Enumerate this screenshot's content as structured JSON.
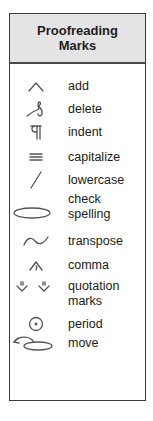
{
  "header": {
    "line1": "Proofreading",
    "line2": "Marks"
  },
  "marks": [
    {
      "icon": "caret-icon",
      "label": "add"
    },
    {
      "icon": "delete-loop-icon",
      "label": "delete"
    },
    {
      "icon": "paragraph-icon",
      "label": "indent"
    },
    {
      "icon": "triple-underline-icon",
      "label": "capitalize"
    },
    {
      "icon": "slash-icon",
      "label": "lowercase"
    },
    {
      "icon": "ellipse-icon",
      "label_line1": "check",
      "label_line2": "spelling"
    },
    {
      "icon": "tilde-icon",
      "label": "transpose"
    },
    {
      "icon": "comma-caret-icon",
      "label": "comma"
    },
    {
      "icon": "quote-caret-icon",
      "label_line1": "quotation",
      "label_line2": "marks"
    },
    {
      "icon": "circled-dot-icon",
      "label": "period"
    },
    {
      "icon": "move-arrow-icon",
      "label": "move"
    }
  ],
  "colors": {
    "header_bg": "#e4e4e4",
    "border": "#3a3a3a",
    "mark_stroke": "#555555"
  }
}
